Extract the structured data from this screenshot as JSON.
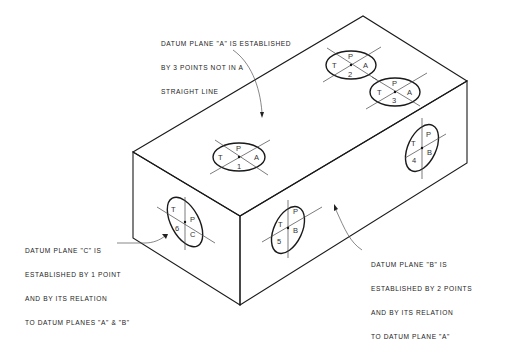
{
  "diagram": {
    "colors": {
      "line": "#1a1a1a",
      "text": "#222222",
      "background": "#ffffff"
    },
    "notes": {
      "datum_a": {
        "lines": [
          "DATUM PLANE \"A\" IS ESTABLISHED",
          "BY 3 POINTS NOT IN A",
          "STRAIGHT LINE"
        ]
      },
      "datum_b": {
        "lines": [
          "DATUM PLANE \"B\" IS",
          "ESTABLISHED BY 2 POINTS",
          "AND BY ITS RELATION",
          "TO DATUM PLANE \"A\""
        ]
      },
      "datum_c": {
        "lines": [
          "DATUM PLANE \"C\" IS",
          "ESTABLISHED BY 1 POINT",
          "AND BY ITS RELATION",
          "TO DATUM PLANES \"A\" & \"B\""
        ]
      }
    },
    "targets": [
      {
        "id": "target-1",
        "face": "top",
        "T": "T",
        "P": "P",
        "datum": "A",
        "number": "1"
      },
      {
        "id": "target-2",
        "face": "top",
        "T": "T",
        "P": "P",
        "datum": "A",
        "number": "2"
      },
      {
        "id": "target-3",
        "face": "top",
        "T": "T",
        "P": "P",
        "datum": "A",
        "number": "3"
      },
      {
        "id": "target-4",
        "face": "right",
        "T": "T",
        "P": "P",
        "datum": "B",
        "number": "4"
      },
      {
        "id": "target-5",
        "face": "front",
        "T": "T",
        "P": "P",
        "datum": "B",
        "number": "5"
      },
      {
        "id": "target-6",
        "face": "left",
        "T": "T",
        "P": "P",
        "datum": "C",
        "number": "6"
      }
    ]
  }
}
